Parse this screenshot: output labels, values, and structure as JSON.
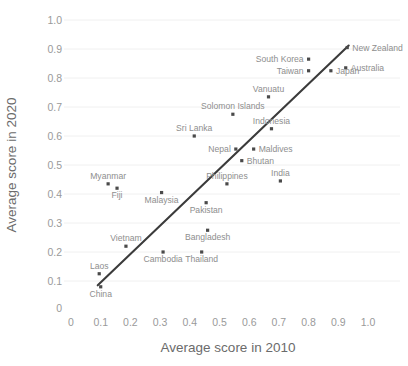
{
  "chart_data": {
    "type": "scatter",
    "title": "",
    "xlabel": "Average score in 2010",
    "ylabel": "Average score in 2020",
    "xlim": [
      0,
      1.05
    ],
    "ylim": [
      0,
      1.05
    ],
    "grid": "horizontal-faint",
    "legend": "none",
    "x_ticks": [
      "0",
      "0.1",
      "0.2",
      "0.3",
      "0.4",
      "0.5",
      "0.6",
      "0.7",
      "0.8",
      "0.9",
      "1.0"
    ],
    "x_tick_values": [
      0,
      0.1,
      0.2,
      0.3,
      0.4,
      0.5,
      0.6,
      0.7,
      0.8,
      0.9,
      1.0
    ],
    "y_ticks": [
      "0",
      "0.1",
      "0.2",
      "0.3",
      "0.4",
      "0.5",
      "0.6",
      "0.7",
      "0.8",
      "0.9",
      "1.0"
    ],
    "y_tick_values": [
      0,
      0.1,
      0.2,
      0.3,
      0.4,
      0.5,
      0.6,
      0.7,
      0.8,
      0.9,
      1.0
    ],
    "marker_color": "#4a4a4a",
    "trendline_color": "#3b3b3b",
    "label_color": "#8e8e8e",
    "trendline": {
      "x0": 0.09,
      "y0": 0.085,
      "x1": 0.935,
      "y1": 0.912
    },
    "points": [
      {
        "label": "New Zealand",
        "x": 0.93,
        "y": 0.905,
        "pos": "right"
      },
      {
        "label": "South Korea",
        "x": 0.8,
        "y": 0.865,
        "pos": "left"
      },
      {
        "label": "Australia",
        "x": 0.925,
        "y": 0.835,
        "pos": "right"
      },
      {
        "label": "Japan",
        "x": 0.875,
        "y": 0.825,
        "pos": "right"
      },
      {
        "label": "Taiwan",
        "x": 0.8,
        "y": 0.825,
        "pos": "left"
      },
      {
        "label": "Vanuatu",
        "x": 0.665,
        "y": 0.735,
        "pos": "above"
      },
      {
        "label": "Solomon Islands",
        "x": 0.545,
        "y": 0.675,
        "pos": "above"
      },
      {
        "label": "Indonesia",
        "x": 0.675,
        "y": 0.625,
        "pos": "above"
      },
      {
        "label": "Sri Lanka",
        "x": 0.415,
        "y": 0.6,
        "pos": "above"
      },
      {
        "label": "Maldives",
        "x": 0.615,
        "y": 0.555,
        "pos": "right"
      },
      {
        "label": "Nepal",
        "x": 0.555,
        "y": 0.555,
        "pos": "left"
      },
      {
        "label": "Bhutan",
        "x": 0.575,
        "y": 0.515,
        "pos": "right"
      },
      {
        "label": "India",
        "x": 0.705,
        "y": 0.445,
        "pos": "above"
      },
      {
        "label": "Philippines",
        "x": 0.525,
        "y": 0.435,
        "pos": "above"
      },
      {
        "label": "Myanmar",
        "x": 0.125,
        "y": 0.435,
        "pos": "above"
      },
      {
        "label": "Fiji",
        "x": 0.155,
        "y": 0.42,
        "pos": "below"
      },
      {
        "label": "Malaysia",
        "x": 0.305,
        "y": 0.405,
        "pos": "below"
      },
      {
        "label": "Pakistan",
        "x": 0.455,
        "y": 0.37,
        "pos": "below"
      },
      {
        "label": "Bangladesh",
        "x": 0.46,
        "y": 0.275,
        "pos": "below"
      },
      {
        "label": "Vietnam",
        "x": 0.185,
        "y": 0.22,
        "pos": "above"
      },
      {
        "label": "Cambodia",
        "x": 0.31,
        "y": 0.2,
        "pos": "below"
      },
      {
        "label": "Thailand",
        "x": 0.44,
        "y": 0.2,
        "pos": "below"
      },
      {
        "label": "Laos",
        "x": 0.095,
        "y": 0.125,
        "pos": "above"
      },
      {
        "label": "China",
        "x": 0.1,
        "y": 0.08,
        "pos": "below"
      }
    ]
  }
}
